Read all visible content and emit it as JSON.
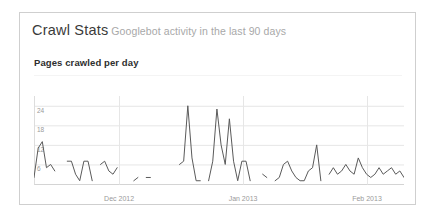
{
  "panel": {
    "title_main": "Crawl Stats",
    "title_sub": "Googlebot activity in the last 90 days",
    "section_title": "Pages crawled per day"
  },
  "colors": {
    "panel_border": "#cfcfcf",
    "title_main": "#3a3a3a",
    "title_sub": "#a8a8a8",
    "section_title": "#2e2e2e",
    "grid": "#e6e6e6",
    "axis_label": "#9a9a9a",
    "line": "#5a5a5a",
    "plot_background": "#ffffff"
  },
  "chart_data": {
    "type": "line",
    "title": "Pages crawled per day",
    "xlabel": "",
    "ylabel": "",
    "ylim": [
      0,
      27
    ],
    "yticks": [
      6,
      12,
      18,
      24
    ],
    "ytick_labels": [
      "6",
      "18",
      "12",
      "24"
    ],
    "grid": true,
    "legend": "none",
    "xtick_labels": [
      "Dec 2012",
      "Jan 2013",
      "Feb 2013"
    ],
    "xtick_positions": [
      0.23,
      0.565,
      0.9
    ],
    "gridline_positions": [
      0.23,
      0.565,
      0.9
    ],
    "x_count": 90,
    "series": [
      {
        "name": "Pages crawled per day",
        "values": [
          2,
          11,
          13,
          5,
          6,
          4,
          null,
          null,
          7,
          7,
          3,
          1,
          7,
          7,
          1,
          null,
          6,
          7,
          4,
          3,
          5,
          null,
          null,
          null,
          1,
          2,
          null,
          2,
          2,
          null,
          null,
          null,
          null,
          null,
          null,
          6,
          7,
          24,
          8,
          1,
          1,
          null,
          1,
          7,
          23,
          12,
          6,
          20,
          7,
          1,
          7,
          7,
          1,
          null,
          null,
          3,
          2,
          null,
          1,
          2,
          6,
          7,
          4,
          2,
          1,
          1,
          4,
          5,
          12,
          1,
          null,
          3,
          5,
          3,
          4,
          6,
          4,
          3,
          8,
          5,
          3,
          2,
          3,
          5,
          3,
          4,
          5,
          3,
          4,
          2
        ]
      }
    ]
  }
}
